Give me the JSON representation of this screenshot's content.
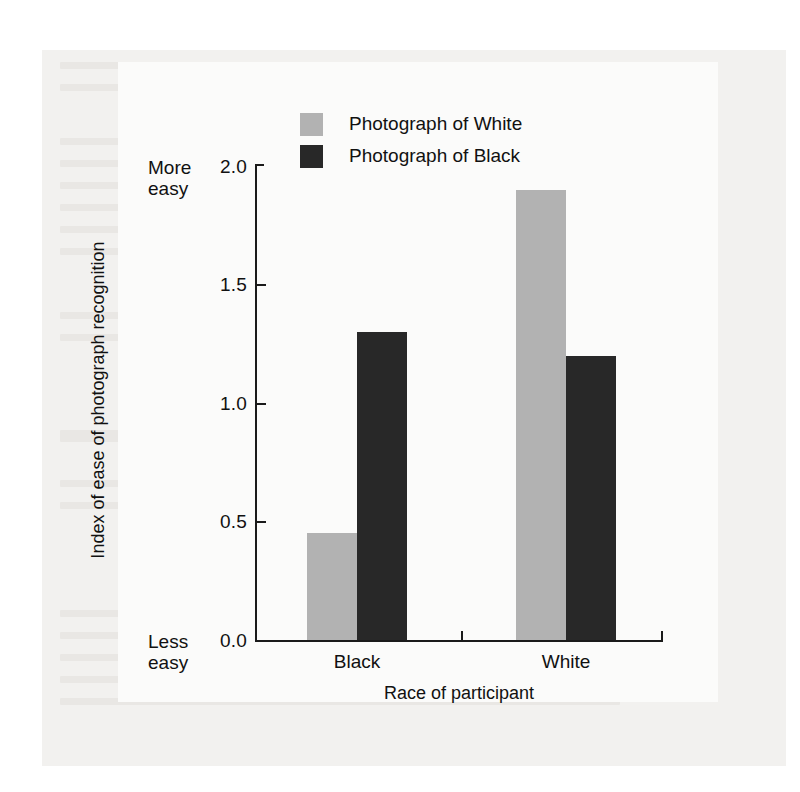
{
  "chart_data": {
    "type": "bar",
    "title": "",
    "xlabel": "Race of participant",
    "ylabel": "Index of ease of photograph recognition",
    "categories": [
      "Black",
      "White"
    ],
    "series": [
      {
        "name": "Photograph of White",
        "color": "#b2b2b2",
        "values": [
          0.45,
          1.9
        ]
      },
      {
        "name": "Photograph of Black",
        "color": "#282828",
        "values": [
          1.3,
          1.2
        ]
      }
    ],
    "ylim": [
      0.0,
      2.0
    ],
    "ytick_labels": [
      "2.0",
      "1.5",
      "1.0",
      "0.5",
      "0.0"
    ],
    "ytick_values": [
      2.0,
      1.5,
      1.0,
      0.5,
      0.0
    ],
    "grid": false,
    "legend_position": "top-center",
    "axis_anchor_high": "More\neasy",
    "axis_anchor_low": "Less\neasy"
  },
  "axes": {
    "y_anchor_high_line1": "More",
    "y_anchor_high_line2": "easy",
    "y_anchor_low_line1": "Less",
    "y_anchor_low_line2": "easy",
    "y_title": "Index of ease of photograph recognition",
    "x_title": "Race of participant",
    "y_ticks": [
      {
        "label": "2.0",
        "value": 2.0
      },
      {
        "label": "1.5",
        "value": 1.5
      },
      {
        "label": "1.0",
        "value": 1.0
      },
      {
        "label": "0.5",
        "value": 0.5
      },
      {
        "label": "0.0",
        "value": 0.0
      }
    ],
    "x_ticks": [
      {
        "label": "Black"
      },
      {
        "label": "White"
      }
    ]
  },
  "legend": {
    "items": [
      {
        "label": "Photograph of White",
        "color": "#b2b2b2"
      },
      {
        "label": "Photograph of Black",
        "color": "#282828"
      }
    ]
  },
  "colors": {
    "page_background": "#ffffff",
    "scan_sheet": "#f2f1ef",
    "figure_panel": "#fbfbfa",
    "axis": "#1a1a1a",
    "bar_white_photo": "#b2b2b2",
    "bar_black_photo": "#282828",
    "text": "#111111"
  }
}
